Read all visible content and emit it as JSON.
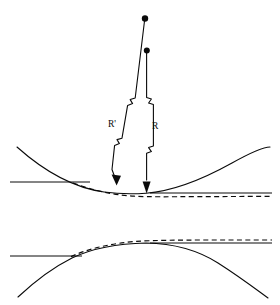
{
  "figure": {
    "background_color": "#ffffff",
    "ink_color": "#0a0a0a",
    "labels": {
      "r_prime": "R'",
      "r": "R"
    },
    "panels": [
      {
        "name": "upper-panel",
        "description": "concave-up mirror surface with dashed paraboloid approximation",
        "surface_orientation": "concave-up",
        "axis_left": {
          "x1": 10,
          "y1": 182,
          "x2": 90,
          "y2": 182
        },
        "axis_right": {
          "x1": 185,
          "y1": 193,
          "x2": 272,
          "y2": 193
        },
        "solid_curve": "M 18,148 Q 90,200 146,193 Q 210,186 270,148",
        "dashed_curve": "M 74,183 Q 118,197 160,196 L 272,196",
        "vertex": {
          "x": 146,
          "y": 193
        }
      },
      {
        "name": "lower-panel",
        "description": "concave-down mirror surface with dashed paraboloid approximation",
        "surface_orientation": "concave-down",
        "axis_left": {
          "x1": 10,
          "y1": 256,
          "x2": 80,
          "y2": 256
        },
        "axis_right": {
          "x1": 192,
          "y1": 243,
          "x2": 272,
          "y2": 243
        },
        "solid_curve": "M 18,297 Q 80,252 146,243 Q 212,252 268,295",
        "dashed_curve": "M 72,256 Q 116,243 158,241 L 272,240",
        "vertex": {
          "x": 146,
          "y": 243
        }
      }
    ],
    "radii": [
      {
        "name": "r-prime-ray",
        "label": "R'",
        "center_of_curvature": {
          "x": 145,
          "y": 18
        },
        "arrow_tip": {
          "x": 116,
          "y": 184
        },
        "has_break_marks": true,
        "break_count": 2,
        "style": "slanted"
      },
      {
        "name": "r-ray",
        "label": "R",
        "center_of_curvature": {
          "x": 147,
          "y": 50
        },
        "arrow_tip": {
          "x": 146,
          "y": 192
        },
        "has_break_marks": true,
        "break_count": 2,
        "style": "vertical"
      }
    ]
  }
}
